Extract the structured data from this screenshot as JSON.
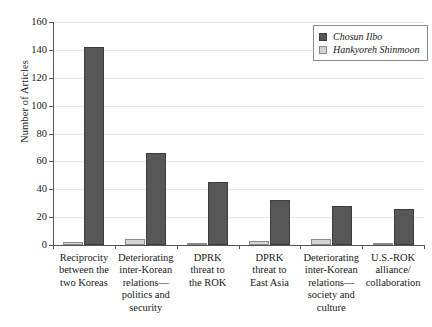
{
  "chart_data": {
    "type": "bar",
    "title": "",
    "xlabel": "",
    "ylabel": "Number of Articles",
    "ylim": [
      0,
      160
    ],
    "ytick_step": 20,
    "yticks": [
      0,
      20,
      40,
      60,
      80,
      100,
      120,
      140,
      160
    ],
    "grid": true,
    "legend_position": "top-right",
    "categories": [
      "Reciprocity between the two Koreas",
      "Deteriorating inter-Korean relations—politics and security",
      "DPRK threat to the ROK",
      "DPRK threat to East Asia",
      "Deteriorating inter-Korean relations—society and culture",
      "U.S.-ROK alliance/collaboration"
    ],
    "category_lines": [
      [
        "Reciprocity",
        "between the",
        "two Koreas"
      ],
      [
        "Deteriorating",
        "inter-Korean",
        "relations—",
        "politics and",
        "security"
      ],
      [
        "DPRK",
        "threat to",
        "the ROK"
      ],
      [
        "DPRK",
        "threat to",
        "East Asia"
      ],
      [
        "Deteriorating",
        "inter-Korean",
        "relations—",
        "society and",
        "culture"
      ],
      [
        "U.S.-ROK",
        "alliance/",
        "collaboration"
      ]
    ],
    "series": [
      {
        "name": "Chosun Ilbo",
        "color": "#575757",
        "values": [
          142,
          66,
          45,
          32,
          28,
          26
        ]
      },
      {
        "name": "Hankyoreh Shinmoon",
        "color": "#d4d4d4",
        "values": [
          2,
          4,
          1,
          3,
          4,
          1
        ]
      }
    ]
  },
  "legend": {
    "items": [
      {
        "label": "Chosun Ilbo"
      },
      {
        "label": "Hankyoreh Shinmoon"
      }
    ]
  }
}
